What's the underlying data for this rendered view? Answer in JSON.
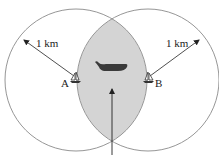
{
  "diagram": {
    "circle_a": {
      "cx": 76,
      "cy": 80,
      "r": 71
    },
    "circle_b": {
      "cx": 148,
      "cy": 80,
      "r": 71
    },
    "colors": {
      "circle_stroke": "#8a8a8a",
      "overlap_fill": "#d4d4d4",
      "arrow": "#222222",
      "whale": "#3a3a3a",
      "boat": "#333333"
    },
    "labels": {
      "radius_left": "1 km",
      "radius_right": "1 km",
      "point_a": "A",
      "point_b": "B"
    },
    "icons": {
      "boat_a": "sailboat-icon",
      "boat_b": "sailboat-icon",
      "whale": "whale-icon"
    }
  }
}
